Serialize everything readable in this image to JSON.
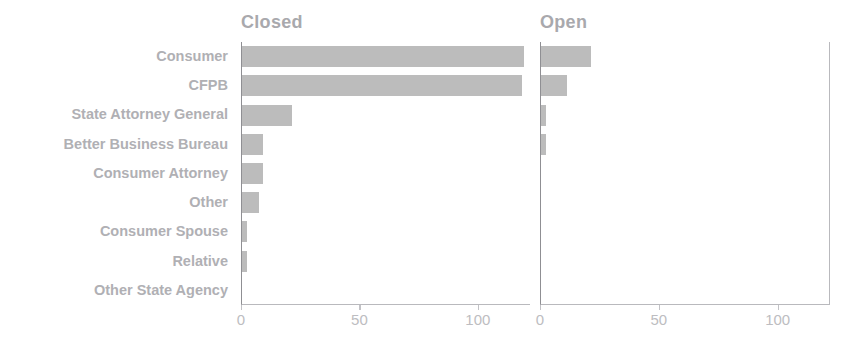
{
  "chart_data": {
    "type": "bar",
    "orientation": "horizontal",
    "title": "",
    "subtitle": "",
    "xlabel": "",
    "ylabel": "",
    "grid": false,
    "legend_position": "none",
    "facet_titles": [
      "Closed",
      "Open"
    ],
    "categories": [
      "Consumer",
      "CFPB",
      "State Attorney General",
      "Better Business Bureau",
      "Consumer Attorney",
      "Other",
      "Consumer Spouse",
      "Relative",
      "Other State Agency"
    ],
    "series": [
      {
        "name": "Closed",
        "values": [
          119,
          118,
          21,
          9,
          9,
          7,
          2,
          2,
          0
        ]
      },
      {
        "name": "Open",
        "values": [
          21,
          11,
          2,
          2,
          0,
          0,
          0,
          0,
          0
        ]
      }
    ],
    "xlim": [
      0,
      122
    ],
    "xticks": [
      0,
      50,
      100
    ],
    "xtick_labels": [
      "0",
      "50",
      "100"
    ],
    "bar_color": "#bcbcbc",
    "label_color": "#b0b0b4",
    "axis_color": "#b9b9bd"
  }
}
